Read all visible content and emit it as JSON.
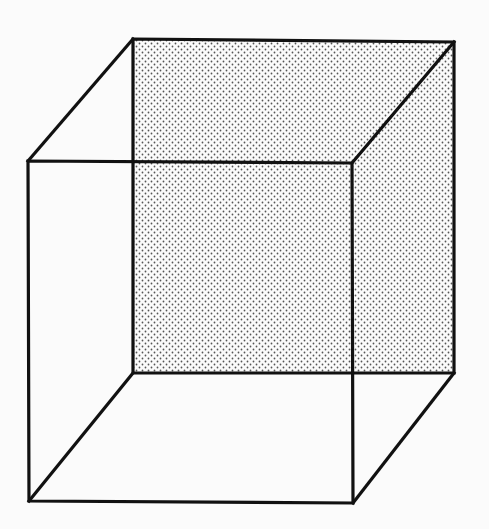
{
  "figure": {
    "type": "necker-cube",
    "background_color": "#fbfbfb",
    "line_color": "#111111",
    "shading": {
      "face": "back",
      "pattern": "dot-stipple",
      "dot_color": "#555555",
      "dot_spacing": 6
    },
    "vertices": {
      "front_top_left": [
        28,
        161
      ],
      "front_top_right": [
        352,
        163
      ],
      "front_bottom_right": [
        353,
        503
      ],
      "front_bottom_left": [
        29,
        501
      ],
      "back_top_left": [
        133,
        39
      ],
      "back_top_right": [
        454,
        42
      ],
      "back_bottom_right": [
        454,
        373
      ],
      "back_bottom_left": [
        133,
        373
      ]
    }
  }
}
